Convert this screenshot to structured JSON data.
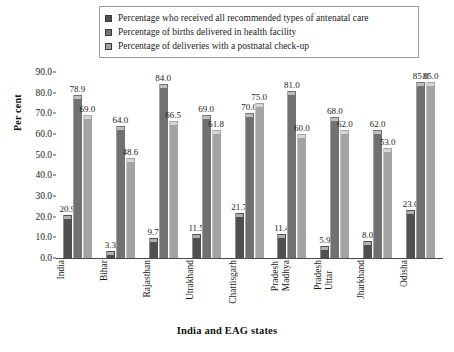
{
  "chart_data": {
    "type": "bar",
    "title": "",
    "xlabel": "India and EAG states",
    "ylabel": "Per cent",
    "ylim": [
      0,
      90
    ],
    "ytick_step": 10,
    "ytick_labels": [
      "90.0",
      "80.0",
      "70.0",
      "60.0",
      "50.0",
      "40.0",
      "30.0",
      "20.0",
      "10.0",
      "0.0"
    ],
    "grid": false,
    "legend_position": "top",
    "categories": [
      "India",
      "Bihar",
      "Rajasthan",
      "Utrakhand",
      "Chattisgarh",
      "Madhya Pradesh",
      "Uttar Pradesh",
      "Jharkhand",
      "Odisha"
    ],
    "category_lines": [
      [
        "India"
      ],
      [
        "Bihar"
      ],
      [
        "Rajasthan"
      ],
      [
        "Utrakhand"
      ],
      [
        "Chattisgarh"
      ],
      [
        "Madhya",
        "Pradesh"
      ],
      [
        "Uttar",
        "Pradesh"
      ],
      [
        "Jharkhand"
      ],
      [
        "Odisha"
      ]
    ],
    "series": [
      {
        "name": "Percentage who received all recommended types of antenatal care",
        "color": "#4f4f4f",
        "values": [
          20.9,
          3.3,
          9.7,
          11.5,
          21.7,
          11.4,
          5.9,
          8.0,
          23.0
        ],
        "labels": [
          "20.9",
          "3.3",
          "9.7",
          "11.5",
          "21.7",
          "11.4",
          "5.9",
          "8.0",
          "23.0"
        ]
      },
      {
        "name": "Percentage of births delivered in health facility",
        "color": "#717171",
        "values": [
          78.9,
          64.0,
          84.0,
          69.0,
          70.0,
          81.0,
          68.0,
          62.0,
          85.0
        ],
        "labels": [
          "78.9",
          "64.0",
          "84.0",
          "69.0",
          "70.0",
          "81.0",
          "68.0",
          "62.0",
          "85.0"
        ]
      },
      {
        "name": "Percentage of deliveries with a postnatal check-up",
        "color": "#a3a3a3",
        "values": [
          69.0,
          48.6,
          66.5,
          61.8,
          75.0,
          60.0,
          62.0,
          53.0,
          85.0
        ],
        "labels": [
          "69.0",
          "48.6",
          "66.5",
          "61.8",
          "75.0",
          "60.0",
          "62.0",
          "53.0",
          "85.0"
        ]
      }
    ]
  }
}
